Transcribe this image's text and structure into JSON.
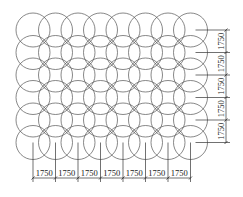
{
  "diagram": {
    "type": "circle-grid-layout",
    "columns": 8,
    "rows": 6,
    "line_color": "#555555",
    "dim_color": "#333333",
    "horizontal_dimensions": [
      "1750",
      "1750",
      "1750",
      "1750",
      "1750",
      "1750",
      "1750"
    ],
    "vertical_dimensions": [
      "1750",
      "1750",
      "1750",
      "1750",
      "1750"
    ]
  }
}
